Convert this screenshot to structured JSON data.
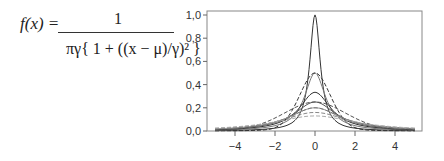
{
  "formula": {
    "lhs": "f(x) =",
    "numerator": "1",
    "denominator": "πγ{ 1 + ((x − μ)/γ)² }"
  },
  "chart_data": {
    "type": "line",
    "xlabel": "",
    "ylabel": "",
    "xlim": [
      -5.4,
      5.4
    ],
    "ylim": [
      0,
      1.05
    ],
    "xticks": [
      -4,
      -2,
      0,
      2,
      4
    ],
    "xtick_labels": [
      "−4",
      "−2",
      "0",
      "2",
      "4"
    ],
    "yticks": [
      0.0,
      0.2,
      0.4,
      0.6,
      0.8,
      1.0
    ],
    "ytick_labels": [
      "0,0",
      "0,2",
      "0,4",
      "0,6",
      "0,8",
      "1,0"
    ],
    "grid": false,
    "legend": null,
    "x_range": [
      -5,
      5
    ],
    "series": [
      {
        "name": "solid γ≈0.32 (peak 1.0)",
        "mu": 0,
        "gamma": 0.318,
        "style": "solid",
        "color": "#333333",
        "peak": 1.0
      },
      {
        "name": "solid γ≈0.64 (peak 0.5)",
        "mu": 0,
        "gamma": 0.637,
        "style": "solid",
        "color": "#777777",
        "peak": 0.5
      },
      {
        "name": "solid γ≈0.95 (peak 0.33)",
        "mu": 0,
        "gamma": 0.955,
        "style": "solid",
        "color": "#333333",
        "peak": 0.333
      },
      {
        "name": "solid γ≈1.27 (peak 0.25)",
        "mu": 0,
        "gamma": 1.273,
        "style": "solid",
        "color": "#555555",
        "peak": 0.25
      },
      {
        "name": "solid γ≈1.59 (peak 0.2)",
        "mu": 0,
        "gamma": 1.59,
        "style": "solid",
        "color": "#999999",
        "peak": 0.2
      },
      {
        "name": "dashed narrow (peak 0.5)",
        "mu": 0,
        "gamma": 0.637,
        "style": "dashed-normal",
        "sigma": 0.8,
        "color": "#333333",
        "peak": 0.5
      },
      {
        "name": "dashed (peak 0.25)",
        "mu": 0,
        "gamma": 1.4,
        "style": "dashed-normal",
        "sigma": 1.6,
        "color": "#555555",
        "peak": 0.25
      },
      {
        "name": "dashed (peak 0.2)",
        "mu": 0,
        "gamma": 1.59,
        "style": "dashed",
        "color": "#777777",
        "peak": 0.2
      },
      {
        "name": "dashed (peak 0.16)",
        "mu": 0,
        "gamma": 1.99,
        "style": "dashed",
        "color": "#888888",
        "peak": 0.16
      },
      {
        "name": "dashed (peak 0.13)",
        "mu": 0,
        "gamma": 2.45,
        "style": "dashed",
        "color": "#aaaaaa",
        "peak": 0.13
      }
    ]
  }
}
